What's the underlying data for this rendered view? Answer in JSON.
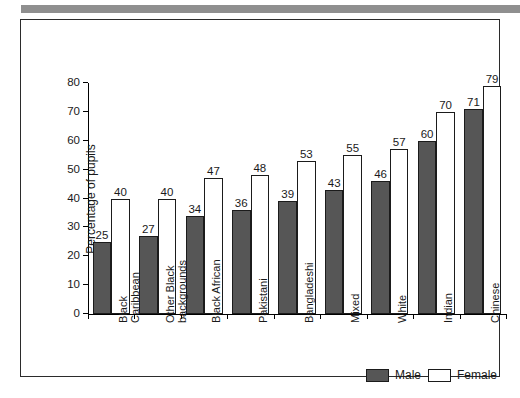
{
  "figure": {
    "top_rule_color": "#8f8f8f",
    "frame_color": "#2b2b2b"
  },
  "legend": {
    "position": "bottom-right",
    "items": [
      {
        "label": "Male",
        "color": "#565656",
        "swatch": "male-swatch"
      },
      {
        "label": "Female",
        "color": "#ffffff",
        "swatch": "female-swatch"
      }
    ]
  },
  "chart_data": {
    "type": "bar",
    "title": "",
    "xlabel": "",
    "ylabel": "Percentage of pupils",
    "ylim": [
      0,
      80
    ],
    "yticks": [
      0,
      10,
      20,
      30,
      40,
      50,
      60,
      70,
      80
    ],
    "grid": false,
    "legend_position": "bottom-right",
    "categories": [
      "Black\nCaribbean",
      "Other Black\nbackgrounds",
      "Black African",
      "Pakistani",
      "Bangladeshi",
      "Mixed",
      "White",
      "Indian",
      "Chinese"
    ],
    "series": [
      {
        "name": "Male",
        "color": "#565656",
        "values": [
          25,
          27,
          34,
          36,
          39,
          43,
          46,
          60,
          71
        ]
      },
      {
        "name": "Female",
        "color": "#ffffff",
        "values": [
          40,
          40,
          47,
          48,
          53,
          55,
          57,
          70,
          79
        ]
      }
    ]
  }
}
